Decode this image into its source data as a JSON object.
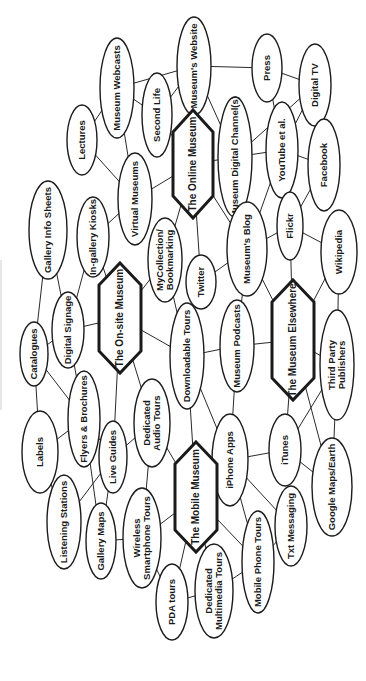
{
  "diagram": {
    "orientation": "rotated-90-ccw",
    "hubs": [
      {
        "id": "online",
        "label": "The Online Museum",
        "cx": 193,
        "cy": 164,
        "w": 40,
        "h": 108
      },
      {
        "id": "onsite",
        "label": "The On-site Museum",
        "cx": 120,
        "cy": 318,
        "w": 42,
        "h": 110
      },
      {
        "id": "elsewhere",
        "label": "The Museum Elsewhere",
        "cx": 293,
        "cy": 340,
        "w": 42,
        "h": 120
      },
      {
        "id": "mobile",
        "label": "The Mobile Museum",
        "cx": 196,
        "cy": 497,
        "w": 42,
        "h": 110
      }
    ],
    "nodes": [
      {
        "id": "webcasts",
        "lines": [
          "Museum Webcasts"
        ],
        "cx": 117,
        "cy": 88,
        "rx": 17,
        "ry": 50
      },
      {
        "id": "secondlife",
        "lines": [
          "Second Life"
        ],
        "cx": 157,
        "cy": 115,
        "rx": 15,
        "ry": 42
      },
      {
        "id": "website",
        "lines": [
          "Museum's Website"
        ],
        "cx": 194,
        "cy": 66,
        "rx": 17,
        "ry": 49
      },
      {
        "id": "press",
        "lines": [
          "Press"
        ],
        "cx": 267,
        "cy": 68,
        "rx": 15,
        "ry": 34
      },
      {
        "id": "digitaltv",
        "lines": [
          "Digital TV"
        ],
        "cx": 315,
        "cy": 85,
        "rx": 16,
        "ry": 41
      },
      {
        "id": "channels",
        "lines": [
          "Museum Digital Channel(s)"
        ],
        "cx": 235,
        "cy": 157,
        "rx": 17,
        "ry": 60
      },
      {
        "id": "youtube",
        "lines": [
          "YouTube et al."
        ],
        "cx": 282,
        "cy": 150,
        "rx": 16,
        "ry": 48
      },
      {
        "id": "facebook",
        "lines": [
          "Facebook"
        ],
        "cx": 324,
        "cy": 165,
        "rx": 16,
        "ry": 46
      },
      {
        "id": "lectures",
        "lines": [
          "Lectures"
        ],
        "cx": 82,
        "cy": 140,
        "rx": 15,
        "ry": 35
      },
      {
        "id": "virtual",
        "lines": [
          "Virtual Museums"
        ],
        "cx": 135,
        "cy": 199,
        "rx": 17,
        "ry": 46
      },
      {
        "id": "infosheets",
        "lines": [
          "Gallery Info Sheets"
        ],
        "cx": 48,
        "cy": 230,
        "rx": 19,
        "ry": 49
      },
      {
        "id": "kiosks",
        "lines": [
          "In-gallery Kiosks"
        ],
        "cx": 93,
        "cy": 237,
        "rx": 16,
        "ry": 40
      },
      {
        "id": "mycollection",
        "lines": [
          "MyCollection/",
          "Bookmarking"
        ],
        "cx": 165,
        "cy": 260,
        "rx": 17,
        "ry": 42
      },
      {
        "id": "twitter",
        "lines": [
          "Twitter"
        ],
        "cx": 201,
        "cy": 282,
        "rx": 15,
        "ry": 27
      },
      {
        "id": "blog",
        "lines": [
          "Museum's Blog"
        ],
        "cx": 247,
        "cy": 249,
        "rx": 20,
        "ry": 47
      },
      {
        "id": "flickr",
        "lines": [
          "Flickr"
        ],
        "cx": 290,
        "cy": 226,
        "rx": 13,
        "ry": 34
      },
      {
        "id": "wikipedia",
        "lines": [
          "Wikipedia"
        ],
        "cx": 339,
        "cy": 252,
        "rx": 18,
        "ry": 42
      },
      {
        "id": "signage",
        "lines": [
          "Digital Signage"
        ],
        "cx": 68,
        "cy": 330,
        "rx": 16,
        "ry": 38
      },
      {
        "id": "catalogues",
        "lines": [
          "Catalogues"
        ],
        "cx": 34,
        "cy": 354,
        "rx": 14,
        "ry": 32
      },
      {
        "id": "downloadable",
        "lines": [
          "Downloadable Tours"
        ],
        "cx": 187,
        "cy": 356,
        "rx": 17,
        "ry": 53
      },
      {
        "id": "podcasts",
        "lines": [
          "Museum Podcasts"
        ],
        "cx": 237,
        "cy": 346,
        "rx": 17,
        "ry": 46
      },
      {
        "id": "thirdparty",
        "lines": [
          "Third Party",
          "Publishers"
        ],
        "cx": 337,
        "cy": 365,
        "rx": 17,
        "ry": 55
      },
      {
        "id": "flyers",
        "lines": [
          "Flyers & Brochures"
        ],
        "cx": 84,
        "cy": 419,
        "rx": 16,
        "ry": 48
      },
      {
        "id": "labels",
        "lines": [
          "Labels"
        ],
        "cx": 40,
        "cy": 452,
        "rx": 18,
        "ry": 41
      },
      {
        "id": "liveguides",
        "lines": [
          "Live Guides"
        ],
        "cx": 113,
        "cy": 457,
        "rx": 14,
        "ry": 36
      },
      {
        "id": "audiotours",
        "lines": [
          "Dedicated",
          "Audio Tours"
        ],
        "cx": 152,
        "cy": 423,
        "rx": 18,
        "ry": 44
      },
      {
        "id": "iphone",
        "lines": [
          "iPhone Apps"
        ],
        "cx": 230,
        "cy": 460,
        "rx": 18,
        "ry": 46
      },
      {
        "id": "itunes",
        "lines": [
          "iTunes"
        ],
        "cx": 285,
        "cy": 450,
        "rx": 16,
        "ry": 36
      },
      {
        "id": "listening",
        "lines": [
          "Listening Stations"
        ],
        "cx": 64,
        "cy": 522,
        "rx": 17,
        "ry": 47
      },
      {
        "id": "gallerymaps",
        "lines": [
          "Gallery Maps"
        ],
        "cx": 101,
        "cy": 541,
        "rx": 15,
        "ry": 38
      },
      {
        "id": "wireless",
        "lines": [
          "Wireless",
          "Smartphone Tours"
        ],
        "cx": 142,
        "cy": 538,
        "rx": 19,
        "ry": 50
      },
      {
        "id": "googlemaps",
        "lines": [
          "Google Maps/Earth"
        ],
        "cx": 332,
        "cy": 487,
        "rx": 20,
        "ry": 49
      },
      {
        "id": "txt",
        "lines": [
          "Txt Messaging"
        ],
        "cx": 291,
        "cy": 526,
        "rx": 16,
        "ry": 40
      },
      {
        "id": "pda",
        "lines": [
          "PDA tours"
        ],
        "cx": 172,
        "cy": 602,
        "rx": 16,
        "ry": 38
      },
      {
        "id": "multimedia",
        "lines": [
          "Dedicated",
          "Multimedia Tours"
        ],
        "cx": 214,
        "cy": 591,
        "rx": 19,
        "ry": 47
      },
      {
        "id": "mobiletours",
        "lines": [
          "Mobile Phone Tours"
        ],
        "cx": 258,
        "cy": 562,
        "rx": 16,
        "ry": 51
      }
    ],
    "edges": [
      [
        "webcasts",
        "lectures"
      ],
      [
        "webcasts",
        "secondlife"
      ],
      [
        "webcasts",
        "website"
      ],
      [
        "webcasts",
        "virtual"
      ],
      [
        "secondlife",
        "online"
      ],
      [
        "secondlife",
        "website"
      ],
      [
        "website",
        "press"
      ],
      [
        "website",
        "channels"
      ],
      [
        "website",
        "online"
      ],
      [
        "press",
        "digitaltv"
      ],
      [
        "press",
        "youtube"
      ],
      [
        "digitaltv",
        "youtube"
      ],
      [
        "digitaltv",
        "channels"
      ],
      [
        "channels",
        "youtube"
      ],
      [
        "channels",
        "online"
      ],
      [
        "youtube",
        "facebook"
      ],
      [
        "youtube",
        "blog"
      ],
      [
        "facebook",
        "flickr"
      ],
      [
        "lectures",
        "virtual"
      ],
      [
        "virtual",
        "online"
      ],
      [
        "virtual",
        "kiosks"
      ],
      [
        "online",
        "mycollection"
      ],
      [
        "online",
        "twitter"
      ],
      [
        "online",
        "blog"
      ],
      [
        "infosheets",
        "signage"
      ],
      [
        "infosheets",
        "catalogues"
      ],
      [
        "kiosks",
        "onsite"
      ],
      [
        "kiosks",
        "signage"
      ],
      [
        "mycollection",
        "onsite"
      ],
      [
        "mycollection",
        "downloadable"
      ],
      [
        "twitter",
        "blog"
      ],
      [
        "blog",
        "flickr"
      ],
      [
        "blog",
        "elsewhere"
      ],
      [
        "blog",
        "podcasts"
      ],
      [
        "flickr",
        "wikipedia"
      ],
      [
        "flickr",
        "elsewhere"
      ],
      [
        "wikipedia",
        "elsewhere"
      ],
      [
        "wikipedia",
        "thirdparty"
      ],
      [
        "onsite",
        "signage"
      ],
      [
        "onsite",
        "downloadable"
      ],
      [
        "onsite",
        "liveguides"
      ],
      [
        "onsite",
        "audiotours"
      ],
      [
        "signage",
        "catalogues"
      ],
      [
        "signage",
        "flyers"
      ],
      [
        "catalogues",
        "flyers"
      ],
      [
        "catalogues",
        "labels"
      ],
      [
        "downloadable",
        "podcasts"
      ],
      [
        "downloadable",
        "iphone"
      ],
      [
        "downloadable",
        "mobile"
      ],
      [
        "podcasts",
        "elsewhere"
      ],
      [
        "podcasts",
        "iphone"
      ],
      [
        "elsewhere",
        "thirdparty"
      ],
      [
        "elsewhere",
        "itunes"
      ],
      [
        "elsewhere",
        "googlemaps"
      ],
      [
        "thirdparty",
        "googlemaps"
      ],
      [
        "thirdparty",
        "itunes"
      ],
      [
        "flyers",
        "labels"
      ],
      [
        "flyers",
        "liveguides"
      ],
      [
        "flyers",
        "gallerymaps"
      ],
      [
        "labels",
        "listening"
      ],
      [
        "liveguides",
        "gallerymaps"
      ],
      [
        "liveguides",
        "listening"
      ],
      [
        "liveguides",
        "audiotours"
      ],
      [
        "audiotours",
        "mobile"
      ],
      [
        "audiotours",
        "wireless"
      ],
      [
        "iphone",
        "mobile"
      ],
      [
        "iphone",
        "itunes"
      ],
      [
        "iphone",
        "txt"
      ],
      [
        "iphone",
        "mobiletours"
      ],
      [
        "itunes",
        "googlemaps"
      ],
      [
        "mobile",
        "wireless"
      ],
      [
        "mobile",
        "mobiletours"
      ],
      [
        "mobile",
        "multimedia"
      ],
      [
        "mobile",
        "pda"
      ],
      [
        "gallerymaps",
        "wireless"
      ],
      [
        "wireless",
        "pda"
      ],
      [
        "pda",
        "multimedia"
      ],
      [
        "multimedia",
        "mobiletours"
      ],
      [
        "mobiletours",
        "txt"
      ]
    ]
  }
}
